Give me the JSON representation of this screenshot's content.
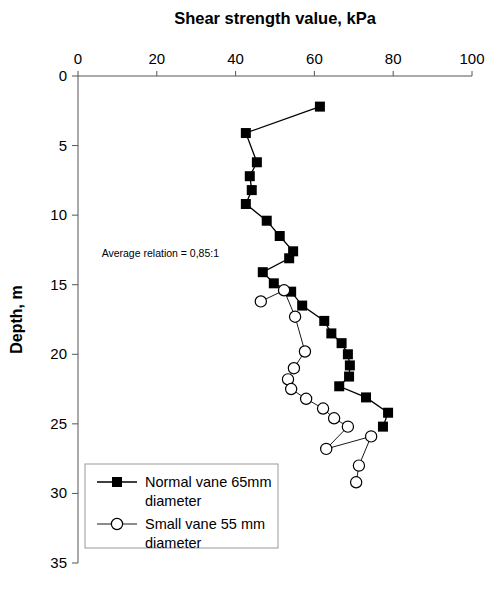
{
  "chart_data": {
    "type": "scatter",
    "title": "Shear strength value, kPa",
    "xlabel": "Shear strength value, kPa",
    "ylabel": "Depth, m",
    "xlim": [
      0,
      100
    ],
    "ylim": [
      0,
      35
    ],
    "y_inverted": true,
    "grid": false,
    "xticks": [
      0,
      20,
      40,
      60,
      80,
      100
    ],
    "yticks": [
      0,
      5,
      10,
      15,
      20,
      25,
      30,
      35
    ],
    "xtick_labels": [
      "0",
      "20",
      "40",
      "60",
      "80",
      "100"
    ],
    "ytick_labels": [
      "0",
      "5",
      "10",
      "15",
      "20",
      "25",
      "30",
      "35"
    ],
    "legend_position": "lower-left",
    "annotations": [
      {
        "text": "Average relation = 0,85:1",
        "x": 6,
        "y": 13.0
      }
    ],
    "series": [
      {
        "name": "Normal vane 65mm diameter",
        "marker": "square-filled",
        "color": "#000000",
        "points": [
          {
            "x": 61.4,
            "y": 2.2
          },
          {
            "x": 42.6,
            "y": 4.1
          },
          {
            "x": 45.4,
            "y": 6.2
          },
          {
            "x": 43.6,
            "y": 7.2
          },
          {
            "x": 44.1,
            "y": 8.2
          },
          {
            "x": 42.6,
            "y": 9.2
          },
          {
            "x": 47.9,
            "y": 10.4
          },
          {
            "x": 51.2,
            "y": 11.5
          },
          {
            "x": 54.6,
            "y": 12.6
          },
          {
            "x": 53.6,
            "y": 13.1
          },
          {
            "x": 46.9,
            "y": 14.1
          },
          {
            "x": 49.7,
            "y": 14.9
          },
          {
            "x": 54.1,
            "y": 15.5
          },
          {
            "x": 56.9,
            "y": 16.5
          },
          {
            "x": 62.5,
            "y": 17.6
          },
          {
            "x": 64.3,
            "y": 18.5
          },
          {
            "x": 66.9,
            "y": 19.2
          },
          {
            "x": 68.5,
            "y": 20.0
          },
          {
            "x": 69.0,
            "y": 20.8
          },
          {
            "x": 68.8,
            "y": 21.6
          },
          {
            "x": 66.3,
            "y": 22.3
          },
          {
            "x": 73.1,
            "y": 23.1
          },
          {
            "x": 78.7,
            "y": 24.2
          },
          {
            "x": 77.4,
            "y": 25.2
          }
        ]
      },
      {
        "name": "Small vane 55 mm diameter",
        "marker": "circle-open",
        "color": "#000000",
        "points": [
          {
            "x": 46.4,
            "y": 16.2
          },
          {
            "x": 52.3,
            "y": 15.4
          },
          {
            "x": 55.1,
            "y": 17.3
          },
          {
            "x": 57.6,
            "y": 19.8
          },
          {
            "x": 54.8,
            "y": 21.0
          },
          {
            "x": 53.3,
            "y": 21.8
          },
          {
            "x": 54.1,
            "y": 22.5
          },
          {
            "x": 57.9,
            "y": 23.2
          },
          {
            "x": 62.2,
            "y": 23.9
          },
          {
            "x": 65.0,
            "y": 24.6
          },
          {
            "x": 68.5,
            "y": 25.2
          },
          {
            "x": 63.0,
            "y": 26.8
          },
          {
            "x": 74.4,
            "y": 25.9
          },
          {
            "x": 71.3,
            "y": 28.0
          },
          {
            "x": 70.6,
            "y": 29.2
          }
        ]
      }
    ]
  },
  "legend": {
    "entries": [
      {
        "label_line1": "Normal vane 65mm",
        "label_line2": "diameter",
        "marker": "square-filled"
      },
      {
        "label_line1": "Small vane 55 mm",
        "label_line2": "diameter",
        "marker": "circle-open"
      }
    ]
  }
}
